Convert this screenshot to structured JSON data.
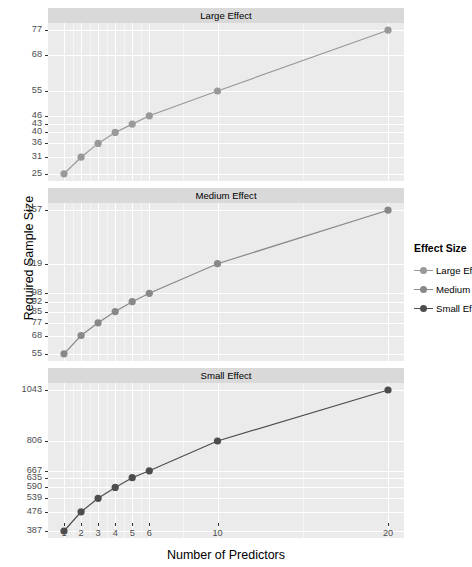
{
  "chart_data": {
    "type": "line",
    "title": "",
    "xlabel": "Number of Predictors",
    "ylabel": "Required Sample Size",
    "x": [
      1,
      2,
      3,
      4,
      5,
      6,
      10,
      20
    ],
    "xticklabels": [
      "1",
      "2",
      "3",
      "4",
      "5",
      "6",
      "10",
      "20"
    ],
    "facets": [
      {
        "label": "Large Effect",
        "series_name": "Large Effect",
        "color": "#999999",
        "values": [
          25,
          31,
          36,
          40,
          43,
          46,
          55,
          77
        ],
        "yticklabels": [
          "25",
          "31",
          "36",
          "40",
          "43",
          "46",
          "55",
          "68",
          "77"
        ],
        "ytickvalues": [
          25,
          31,
          36,
          40,
          43,
          46,
          55,
          68,
          77
        ],
        "ylim": [
          22.4,
          79.6
        ]
      },
      {
        "label": "Medium Effect",
        "series_name": "Medium Effect",
        "color": "#888888",
        "values": [
          55,
          68,
          77,
          85,
          92,
          98,
          119,
          157
        ],
        "yticklabels": [
          "55",
          "68",
          "77",
          "85",
          "92",
          "98",
          "119",
          "157"
        ],
        "ytickvalues": [
          55,
          68,
          77,
          85,
          92,
          98,
          119,
          157
        ],
        "ylim": [
          49.9,
          162.1
        ]
      },
      {
        "label": "Small Effect",
        "series_name": "Small Effect",
        "color": "#4d4d4d",
        "values": [
          387,
          476,
          539,
          590,
          635,
          667,
          806,
          1043
        ],
        "yticklabels": [
          "387",
          "476",
          "539",
          "590",
          "635",
          "667",
          "806",
          "1043"
        ],
        "ytickvalues": [
          387,
          476,
          539,
          590,
          635,
          667,
          806,
          1043
        ],
        "ylim": [
          354.2,
          1075.8
        ]
      }
    ],
    "legend": {
      "title": "Effect Size",
      "position": "right",
      "entries": [
        {
          "label": "Large Ef",
          "full_label": "Large Effect",
          "color": "#999999"
        },
        {
          "label": "Medium",
          "full_label": "Medium Effect",
          "color": "#888888"
        },
        {
          "label": "Small Ef",
          "full_label": "Small Effect",
          "color": "#4d4d4d"
        }
      ]
    },
    "panel_background": "#ebebeb",
    "strip_background": "#d9d9d9",
    "grid_color": "#ffffff"
  }
}
